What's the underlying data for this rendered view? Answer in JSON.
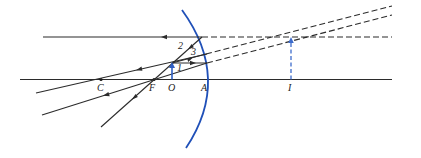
{
  "diagram": {
    "type": "ray diagram — convex mirror image formation",
    "colors": {
      "mirror": "#2050b8",
      "object": "#2f5fc4",
      "image": "#3d6ccc",
      "ray": "#2b2b2b"
    },
    "labels": {
      "C": "C",
      "F": "F",
      "O": "O",
      "A": "A",
      "I": "I"
    },
    "ray_numbers": {
      "ray1": "1",
      "ray2": "2",
      "ray3": "3"
    }
  }
}
